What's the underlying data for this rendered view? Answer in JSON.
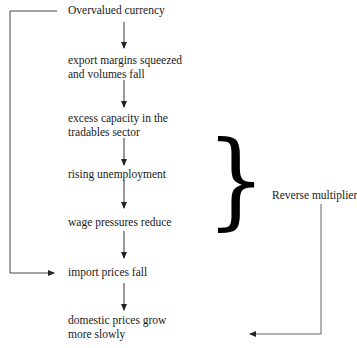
{
  "diagram": {
    "nodes": [
      {
        "id": "overvalued",
        "lines": [
          "Overvalued currency"
        ]
      },
      {
        "id": "export",
        "lines": [
          "export margins squeezed",
          "and volumes fall"
        ]
      },
      {
        "id": "capacity",
        "lines": [
          "excess capacity in the",
          "tradables sector"
        ]
      },
      {
        "id": "unemployment",
        "lines": [
          "rising unemployment"
        ]
      },
      {
        "id": "wage",
        "lines": [
          "wage pressures reduce"
        ]
      },
      {
        "id": "import",
        "lines": [
          "import prices fall"
        ]
      },
      {
        "id": "domestic",
        "lines": [
          "domestic prices grow",
          "more slowly"
        ]
      }
    ],
    "brace_label": "Reverse multiplier",
    "brace_glyph": "}",
    "colors": {
      "text": "#1a1a1a",
      "arrow": "#333333",
      "connector": "#555555"
    }
  }
}
